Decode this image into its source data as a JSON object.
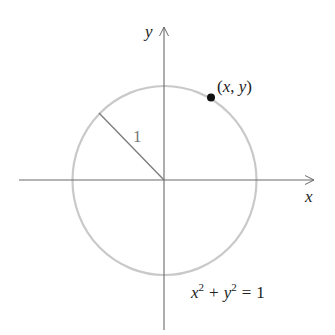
{
  "diagram": {
    "type": "unit-circle",
    "axes": {
      "x_label": "x",
      "y_label": "y"
    },
    "radius_label": "1",
    "point_label": "(x, y)",
    "equation": {
      "x_var": "x",
      "x_exp": "2",
      "plus": "+",
      "y_var": "y",
      "y_exp": "2",
      "equals": "=",
      "rhs": "1"
    },
    "colors": {
      "axis": "#6a6a6a",
      "circle": "#c9c9c9",
      "radius_line": "#7a7a7a",
      "point": "#111111",
      "text": "#222222"
    }
  }
}
